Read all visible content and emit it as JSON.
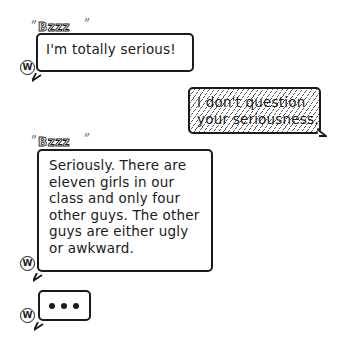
{
  "conversation": {
    "messages": [
      {
        "sender": "W",
        "side": "left",
        "buzz_label": "Bzzz",
        "text": "I'm totally serious!"
      },
      {
        "sender": "self",
        "side": "right",
        "style": "hatched",
        "text": "I don't question\nyour seriousness."
      },
      {
        "sender": "W",
        "side": "left",
        "buzz_label": "Bzzz",
        "text": "Seriously. There are\neleven girls in our\nclass and only four\nother guys. The other\nguys are either ugly\nor awkward."
      }
    ],
    "typing_indicator": {
      "sender": "W",
      "dots": "•••"
    },
    "avatar_letter": "W"
  }
}
